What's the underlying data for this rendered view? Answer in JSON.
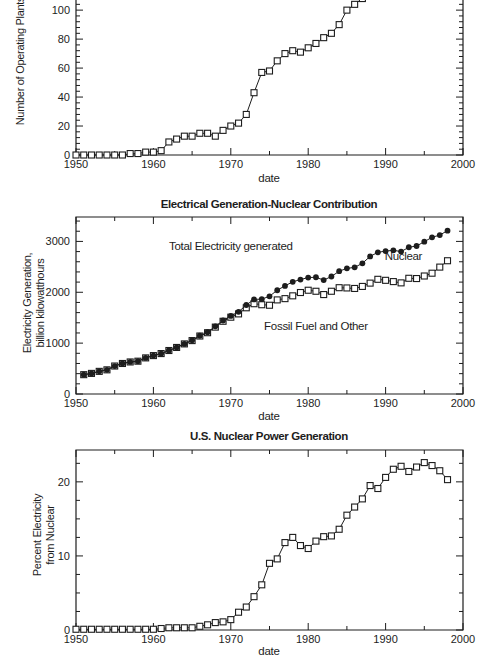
{
  "page": {
    "background": "#ffffff",
    "ink": "#1d1d1d"
  },
  "chart_data": [
    {
      "id": "operating-plants",
      "type": "line",
      "title": "",
      "xlabel": "date",
      "ylabel_lines": [
        "Number of Operating Plants"
      ],
      "xlim": [
        1950,
        2000
      ],
      "ylim": [
        0,
        107
      ],
      "clipped_top": true,
      "x_ticks": [
        1950,
        1960,
        1970,
        1980,
        1990,
        2000
      ],
      "y_ticks": [
        0,
        20,
        40,
        60,
        80,
        100
      ],
      "x_minor_step": 5,
      "y_minor_step": 4,
      "series": [
        {
          "name": "Operating nuclear plants",
          "marker": "open-square",
          "start_year": 1950,
          "values": [
            0,
            0,
            0,
            0,
            0,
            0,
            0,
            1,
            1,
            2,
            2,
            3,
            9,
            11,
            13,
            13,
            15,
            15,
            13,
            17,
            20,
            22,
            28,
            43,
            57,
            58,
            65,
            70,
            72,
            71,
            74,
            77,
            81,
            84,
            90,
            100,
            104,
            108
          ]
        }
      ],
      "annotations": []
    },
    {
      "id": "electrical-generation",
      "type": "line",
      "title": "Electrical Generation-Nuclear Contribution",
      "xlabel": "date",
      "ylabel_lines": [
        "Electricity Generation,",
        "billion kilowatthours"
      ],
      "xlim": [
        1950,
        2000
      ],
      "ylim": [
        0,
        3480
      ],
      "clipped_top": false,
      "x_ticks": [
        1950,
        1960,
        1970,
        1980,
        1990,
        2000
      ],
      "y_ticks": [
        0,
        1000,
        2000,
        3000
      ],
      "x_minor_step": 5,
      "y_minor_step": 200,
      "series": [
        {
          "name": "Fossil Fuel and Other",
          "marker": "open-square",
          "start_year": 1951,
          "values": [
            380,
            405,
            445,
            475,
            550,
            600,
            630,
            645,
            710,
            755,
            795,
            855,
            915,
            985,
            1050,
            1140,
            1205,
            1315,
            1430,
            1510,
            1575,
            1695,
            1775,
            1755,
            1745,
            1850,
            1875,
            1930,
            1995,
            2040,
            2020,
            1955,
            2020,
            2090,
            2085,
            2075,
            2115,
            2180,
            2255,
            2235,
            2210,
            2185,
            2275,
            2270,
            2320,
            2375,
            2495,
            2620
          ]
        },
        {
          "name": "Total Electricity generated",
          "marker": "filled-circle",
          "start_year": 1951,
          "values": [
            380,
            405,
            445,
            475,
            550,
            600,
            630,
            645,
            710,
            755,
            795,
            855,
            915,
            985,
            1055,
            1145,
            1215,
            1330,
            1445,
            1535,
            1615,
            1750,
            1860,
            1865,
            1920,
            2040,
            2125,
            2205,
            2250,
            2290,
            2295,
            2240,
            2310,
            2415,
            2470,
            2490,
            2570,
            2705,
            2785,
            2810,
            2825,
            2800,
            2885,
            2910,
            2995,
            3080,
            3125,
            3212
          ]
        }
      ],
      "annotations": [
        {
          "text": "Total Electricity generated",
          "x": 1970,
          "y": 2915
        },
        {
          "text": "Nuclear",
          "x": 1992.3,
          "y": 2705
        },
        {
          "text": "Fossil Fuel and Other",
          "x": 1981,
          "y": 1345
        }
      ]
    },
    {
      "id": "nuclear-percent",
      "type": "line",
      "title": "U.S. Nuclear Power Generation",
      "xlabel": "date",
      "ylabel_lines": [
        "Percent Electricity",
        "from Nuclear"
      ],
      "xlim": [
        1950,
        2000
      ],
      "ylim": [
        0,
        24.3
      ],
      "clipped_top": false,
      "x_ticks": [
        1950,
        1960,
        1970,
        1980,
        1990,
        2000
      ],
      "y_ticks": [
        0,
        10,
        20
      ],
      "x_minor_step": 5,
      "y_minor_step": 2.5,
      "series": [
        {
          "name": "Percent electricity from nuclear",
          "marker": "open-square",
          "start_year": 1950,
          "values": [
            0.1,
            0.1,
            0.1,
            0.1,
            0.1,
            0.1,
            0.1,
            0.1,
            0.1,
            0.1,
            0.1,
            0.2,
            0.3,
            0.3,
            0.3,
            0.3,
            0.5,
            0.7,
            1.0,
            1.1,
            1.4,
            2.4,
            3.1,
            4.5,
            6.1,
            9.0,
            9.6,
            11.8,
            12.5,
            11.4,
            11.0,
            12.0,
            12.6,
            12.7,
            13.6,
            15.5,
            16.6,
            17.7,
            19.5,
            19.1,
            20.6,
            21.7,
            22.1,
            21.4,
            22.0,
            22.6,
            22.2,
            21.5,
            20.3
          ]
        }
      ],
      "annotations": []
    }
  ]
}
